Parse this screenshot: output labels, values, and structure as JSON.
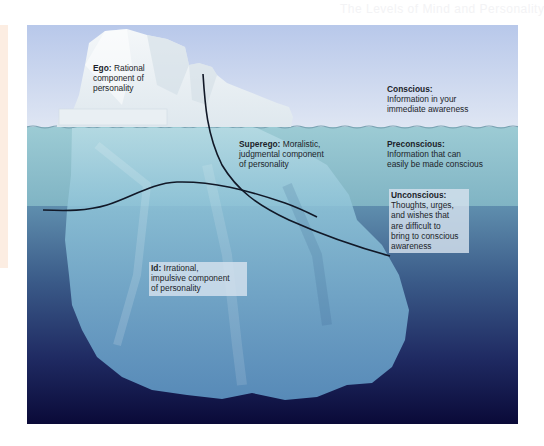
{
  "page": {
    "header_faint": "The Levels of Mind and Personality"
  },
  "diagram": {
    "type": "iceberg",
    "colors": {
      "sky_top": "#b9c9ea",
      "sky_bottom": "#dde5f3",
      "preconscious_water": "#8fc0cc",
      "unconscious_water_top": "#5a88a8",
      "unconscious_water_bottom": "#0c0c3c",
      "ice": "#eef3f5",
      "curve": "#111827"
    },
    "labels": {
      "ego": {
        "title": "Ego:",
        "text": "Rational component of personality",
        "lines": [
          "Rational",
          "component of",
          "personality"
        ]
      },
      "superego": {
        "title": "Superego:",
        "text": "Moralistic, judgmental component of personality",
        "lines": [
          "Moralistic,",
          "judgmental component",
          "of personality"
        ]
      },
      "id": {
        "title": "Id:",
        "text": "Irrational, impulsive component of personality",
        "lines": [
          "Irrational,",
          "impulsive component",
          "of personality"
        ]
      },
      "conscious": {
        "title": "Conscious:",
        "text": "Information in your immediate awareness",
        "lines": [
          "Information in your",
          "immediate awareness"
        ]
      },
      "preconscious": {
        "title": "Preconscious:",
        "text": "Information that can easily be made conscious",
        "lines": [
          "Information that can",
          "easily be made conscious"
        ]
      },
      "unconscious": {
        "title": "Unconscious:",
        "text": "Thoughts, urges, and wishes that are difficult to bring to conscious awareness",
        "lines": [
          "Thoughts, urges,",
          "and wishes that",
          "are difficult to",
          "bring to conscious",
          "awareness"
        ]
      }
    }
  }
}
